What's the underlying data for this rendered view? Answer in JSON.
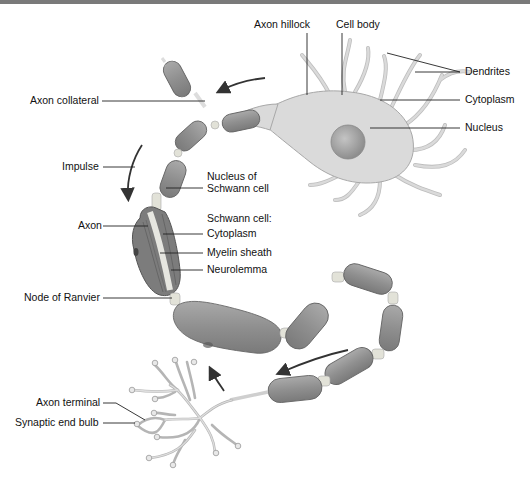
{
  "diagram": {
    "labels": {
      "axon_hillock": "Axon hillock",
      "cell_body": "Cell body",
      "dendrites": "Dendrites",
      "cytoplasm_cell": "Cytoplasm",
      "nucleus": "Nucleus",
      "axon_collateral": "Axon collateral",
      "impulse": "Impulse",
      "nucleus_schwann_line1": "Nucleus of",
      "nucleus_schwann_line2": "Schwann cell",
      "schwann_cell_heading": "Schwann cell:",
      "schwann_cytoplasm": "Cytoplasm",
      "myelin_sheath": "Myelin sheath",
      "neurolemma": "Neurolemma",
      "axon": "Axon",
      "node_of_ranvier": "Node of Ranvier",
      "axon_terminal": "Axon terminal",
      "synaptic_end_bulb": "Synaptic end bulb"
    },
    "colors": {
      "segment": "#8c8c8c",
      "cell_body": "#dadada",
      "nucleus": "#a8a8a8",
      "node": "#e2e2d8",
      "leader_line": "#222222",
      "text": "#111111"
    }
  }
}
